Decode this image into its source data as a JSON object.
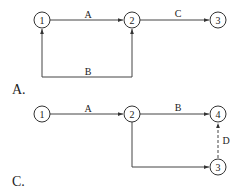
{
  "diagrams": {
    "a": {
      "panel_label": "A.",
      "nodes": {
        "n1": "1",
        "n2": "2",
        "n3": "3"
      },
      "edges": {
        "e12": {
          "label": "A",
          "from": "1",
          "to": "2"
        },
        "e23": {
          "label": "C",
          "from": "2",
          "to": "3"
        },
        "e12b": {
          "label": "B",
          "from": "1",
          "to": "2",
          "style": "loop-below, arrows into both nodes"
        }
      }
    },
    "c": {
      "panel_label": "C.",
      "nodes": {
        "n1": "1",
        "n2": "2",
        "n3": "3",
        "n4": "4"
      },
      "edges": {
        "e12": {
          "label": "A",
          "from": "1",
          "to": "2"
        },
        "e24": {
          "label": "B",
          "from": "2",
          "to": "4"
        },
        "e23": {
          "label": "",
          "from": "2",
          "to": "3",
          "style": "down then right"
        },
        "e34": {
          "label": "D",
          "from": "3",
          "to": "4",
          "style": "dashed"
        }
      }
    }
  },
  "colors": {
    "stroke": "#444444",
    "text": "#222222",
    "background": "#ffffff"
  }
}
